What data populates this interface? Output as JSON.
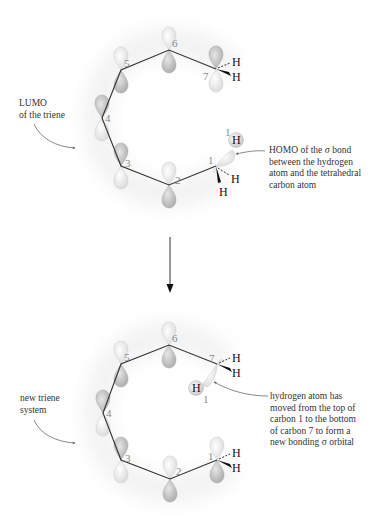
{
  "top_panel": {
    "title": "Triene LUMO and C–H sigma HOMO before [1,7] sigmatropic hydrogen shift",
    "carbon_labels": [
      "1",
      "2",
      "3",
      "4",
      "5",
      "6",
      "7"
    ],
    "hydrogen_label": "H",
    "migrating_h_label": "1",
    "lumo_caption": "LUMO\nof the triene",
    "homo_caption": "HOMO of the σ bond\nbetween the hydrogen\natom and the tetrahedral\ncarbon atom"
  },
  "bottom_panel": {
    "title": "New triene system after hydrogen migration",
    "carbon_labels": [
      "1",
      "2",
      "3",
      "4",
      "5",
      "6",
      "7"
    ],
    "hydrogen_label": "H",
    "migrating_h_label": "1",
    "triene_caption": "new triene\nsystem",
    "migration_caption": "hydrogen atom has\nmoved from the top of\ncarbon 1 to the bottom\nof carbon 7 to form a\nnew bonding σ orbital"
  },
  "reaction_arrow": {
    "direction": "down"
  },
  "colors": {
    "bond": "#333333",
    "lobe_dark": "#b8b8b8",
    "lobe_light": "#ececec",
    "halo": "#f4f4f4",
    "label_gray": "#8a8a8a",
    "text": "#333333"
  }
}
